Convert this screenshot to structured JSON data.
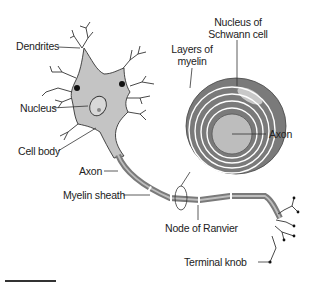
{
  "figure": {
    "colors": {
      "cell_fill": "#c4c4c4",
      "myelin_dark": "#7a7a7a",
      "axon_core": "#bdbdbd",
      "outline": "#333333",
      "background": "#ffffff"
    }
  },
  "labels": {
    "dendrites": "Dendrites",
    "nucleus": "Nucleus",
    "cell_body": "Cell body",
    "axon_left": "Axon",
    "myelin_sheath": "Myelin sheath",
    "node_of_ranvier": "Node of Ranvier",
    "terminal_knob": "Terminal knob",
    "layers_of_myelin_1": "Layers of",
    "layers_of_myelin_2": "myelin",
    "nucleus_schwann_1": "Nucleus of",
    "nucleus_schwann_2": "Schwann cell",
    "axon_right": "Axon"
  },
  "scale_bar": {
    "visible": true
  }
}
